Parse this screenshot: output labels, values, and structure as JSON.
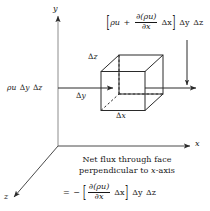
{
  "figure": {
    "background_color": "#ffffff",
    "line_color": "#2a2a2a"
  },
  "axes": {
    "y_label": "y",
    "x_label": "x",
    "z_label": "z"
  },
  "cube": {
    "edge_labels": {
      "dz": "z",
      "dy": "y",
      "dx": "x"
    },
    "delta_symbol": "Δ"
  },
  "flux_in": {
    "rho": "ρ",
    "u": "u",
    "delta": "Δ",
    "dy": "y",
    "dz": "z",
    "full_text": "ρu Δy Δz"
  },
  "flux_out": {
    "open_bracket": "[",
    "close_bracket": "]",
    "rho": "ρ",
    "u": "u",
    "plus": "+",
    "partial": "∂",
    "numerator": "∂(ρu)",
    "denominator": "∂x",
    "dx": "Δx",
    "dy": "Δy",
    "dz": "Δz",
    "full_text": "[ρu + ∂(ρu)/∂x Δx] Δy Δz"
  },
  "caption": {
    "line1": "Net flux through face",
    "line2_pre": "perpendicular to ",
    "line2_italic": "x",
    "line2_post": "-axis",
    "equation": {
      "equals": "=",
      "minus": "−",
      "open_bracket": "[",
      "close_bracket": "]",
      "numerator": "∂(ρu)",
      "denominator": "∂x",
      "dx": "Δx",
      "dy": "Δy",
      "dz": "Δz",
      "full_text": "= − [∂(ρu)/∂x Δx] Δy Δz"
    }
  }
}
